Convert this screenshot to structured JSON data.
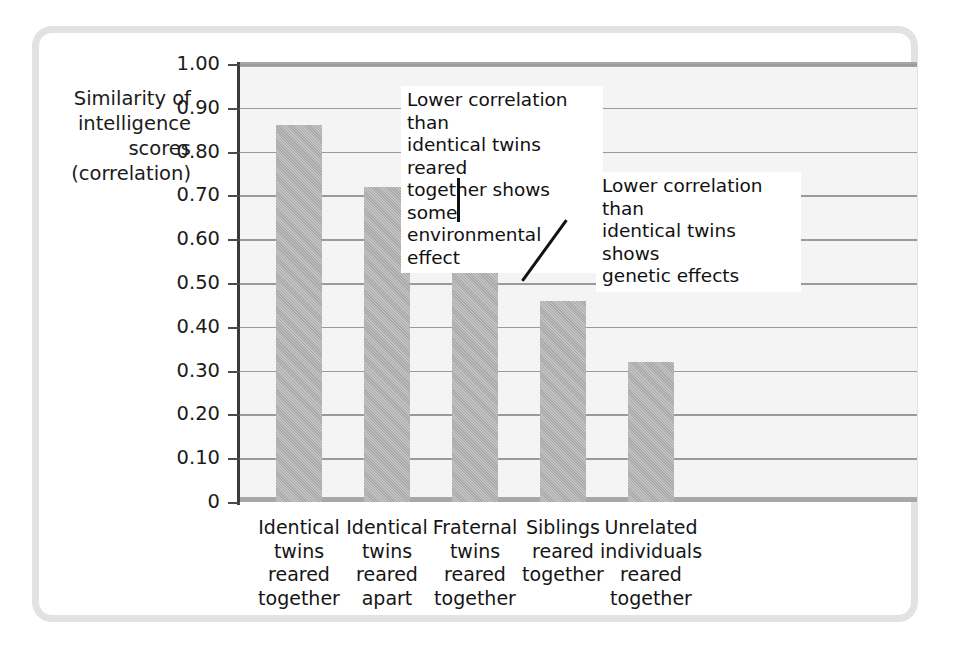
{
  "figure": {
    "frame_color": "#e2e2e2",
    "plot_background": "#f4f4f4",
    "bar_color": "#a9a9a9",
    "gridline_color": "#9a9a9a",
    "axis_color": "#3a3a3a"
  },
  "y_axis": {
    "title": "Similarity of\nintelligence\nscores\n(correlation)",
    "ticks": [
      "1.00",
      "0.90",
      "0.80",
      "0.70",
      "0.60",
      "0.50",
      "0.40",
      "0.30",
      "0.20",
      "0.10",
      "0"
    ]
  },
  "annotations": [
    {
      "id": "annotation-1",
      "text": "Lower correlation than\nidentical twins reared\ntogether shows some\nenvironmental effect",
      "points_to": "Identical twins reared apart"
    },
    {
      "id": "annotation-2",
      "text": "Lower correlation than\nidentical twins shows\ngenetic effects",
      "points_to": "Fraternal twins reared together"
    }
  ],
  "chart_data": {
    "type": "bar",
    "title": "",
    "xlabel": "",
    "ylabel": "Similarity of intelligence scores (correlation)",
    "ylim": [
      0,
      1.0
    ],
    "ytick_values": [
      1.0,
      0.9,
      0.8,
      0.7,
      0.6,
      0.5,
      0.4,
      0.3,
      0.2,
      0.1,
      0
    ],
    "grid": true,
    "legend": "none",
    "categories": [
      "Identical\ntwins\nreared\ntogether",
      "Identical\ntwins\nreared\napart",
      "Fraternal\ntwins\nreared\ntogether",
      "Siblings\nreared\ntogether",
      "Unrelated\nindividuals\nreared\ntogether"
    ],
    "values": [
      0.86,
      0.72,
      0.6,
      0.46,
      0.32
    ],
    "annotations": [
      "Lower correlation than identical twins reared together shows some environmental effect",
      "Lower correlation than identical twins shows genetic effects"
    ]
  }
}
